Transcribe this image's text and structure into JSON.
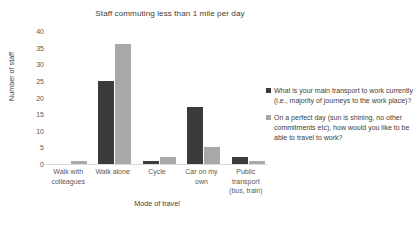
{
  "chart_data": {
    "type": "bar",
    "title": "Staff commuting less than 1 mile per day",
    "xlabel": "Mode of travel",
    "ylabel": "Number of staff",
    "ylim": [
      0,
      40
    ],
    "ytick_step": 5,
    "yticks": [
      40,
      35,
      30,
      25,
      20,
      15,
      10,
      5,
      0
    ],
    "grid": false,
    "legend_position": "right",
    "categories": [
      "Walk with colleagues",
      "Walk alone",
      "Cycle",
      "Car on my own",
      "Public transport (bus, train)"
    ],
    "category_lines": [
      [
        "Walk with",
        "colleagues"
      ],
      [
        "Walk alone"
      ],
      [
        "Cycle"
      ],
      [
        "Car on my",
        "own"
      ],
      [
        "Public",
        "transport",
        "(bus, train)"
      ]
    ],
    "series": [
      {
        "name": "What is your main transport to work currently (i.e., majority of journeys to the work place)?",
        "color": "#3b3b3b",
        "values": [
          0,
          25,
          1,
          17,
          2
        ]
      },
      {
        "name": "On a perfect day (sun is shining, no other commitments etc), how would you like to be able to travel to work?",
        "color": "#a8a8a8",
        "values": [
          1,
          36,
          2,
          5,
          1
        ]
      }
    ]
  }
}
